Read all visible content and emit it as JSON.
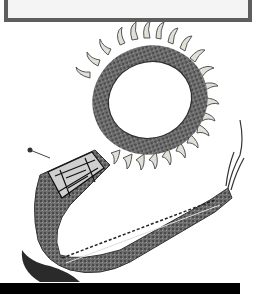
{
  "image": {
    "subject": "claw necklace with beaded strap",
    "alt": "Grayscale photograph of a ring of bear claws strung on a fur-wrapped band, attached to a long tapering hide strap with a beaded geometric panel and fringed end",
    "colors": {
      "background": "#ffffff",
      "box_fill": "#f4f4f4",
      "box_border": "#5e5e5e",
      "fur_dark": "#3a3a3a",
      "fur_mid": "#7a7a7a",
      "claw": "#d8d8d0",
      "bar": "#000000"
    }
  },
  "caption_box": {
    "text": ""
  },
  "bottom_bar": {
    "text": ""
  }
}
